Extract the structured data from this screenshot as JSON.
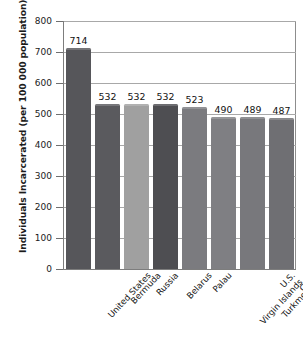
{
  "chart_data": {
    "type": "bar",
    "title": "",
    "xlabel": "",
    "ylabel": "Individuals Incarcerated (per 100 000 population)",
    "ylim": [
      0,
      800
    ],
    "ytick_step": 100,
    "yticks": [
      800,
      700,
      600,
      500,
      400,
      300,
      200,
      100,
      0
    ],
    "ytick_labels": [
      "800",
      "700",
      "600",
      "500",
      "400",
      "300",
      "200",
      "100",
      "0"
    ],
    "grid": true,
    "grid_axis": "y",
    "legend": false,
    "categories": [
      "United States",
      "Bermuda",
      "Russia",
      "Belarus",
      "Palau",
      "U.S. Virgin Islands",
      "Turkmenistan",
      "Cuba"
    ],
    "category_lines": [
      [
        "United States"
      ],
      [
        "Bermuda"
      ],
      [
        "Russia"
      ],
      [
        "Belarus"
      ],
      [
        "Palau"
      ],
      [
        "U.S.",
        "Virgin Islands"
      ],
      [
        "Turkmenistan"
      ],
      [
        "Cuba"
      ]
    ],
    "values": [
      714,
      532,
      532,
      532,
      523,
      490,
      489,
      487
    ],
    "value_labels": [
      "714",
      "532",
      "532",
      "532",
      "523",
      "490",
      "489",
      "487"
    ],
    "bar_colors": [
      "#56565a",
      "#5a5a5e",
      "#a0a0a0",
      "#4e4e52",
      "#7b7b7f",
      "#7f7f83",
      "#78787c",
      "#6f6f73"
    ],
    "axis_color": "#7d7d7d",
    "grid_color": "#a8a8a8",
    "text_color": "#141414",
    "background": "#ffffff"
  }
}
